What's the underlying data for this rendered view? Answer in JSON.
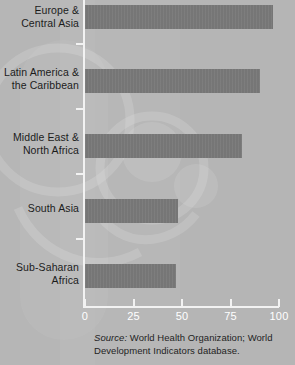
{
  "chart_data": {
    "type": "bar",
    "orientation": "horizontal",
    "title": "",
    "subtitle": "",
    "xlabel": "",
    "ylabel": "",
    "categories": [
      "Europe &\nCentral Asia",
      "Latin America &\nthe Caribbean",
      "Middle East &\nNorth Africa",
      "South Asia",
      "Sub-Saharan\nAfrica"
    ],
    "values": [
      97,
      90,
      81,
      48,
      47
    ],
    "xlim": [
      0,
      100
    ],
    "xticks": [
      0,
      25,
      50,
      75,
      100
    ],
    "xtick_labels": [
      "0",
      "25",
      "50",
      "75",
      "100"
    ],
    "grid": false,
    "legend": null,
    "bar_color": "#767676",
    "axis_color": "#f2f2f2",
    "background_color": "#b4b4b4",
    "text_color": "#1c1c1c"
  },
  "categories": [
    {
      "line1": "Europe &",
      "line2": "Central Asia"
    },
    {
      "line1": "Latin America &",
      "line2": "the Caribbean"
    },
    {
      "line1": "Middle East &",
      "line2": "North Africa"
    },
    {
      "line1": "South Asia",
      "line2": ""
    },
    {
      "line1": "Sub-Saharan",
      "line2": "Africa"
    }
  ],
  "axis": {
    "ticks": [
      {
        "label": "0"
      },
      {
        "label": "25"
      },
      {
        "label": "50"
      },
      {
        "label": "75"
      },
      {
        "label": "100"
      }
    ]
  },
  "source": {
    "lead": "Source:",
    "text": " World Health Organization; World Development Indicators database."
  }
}
